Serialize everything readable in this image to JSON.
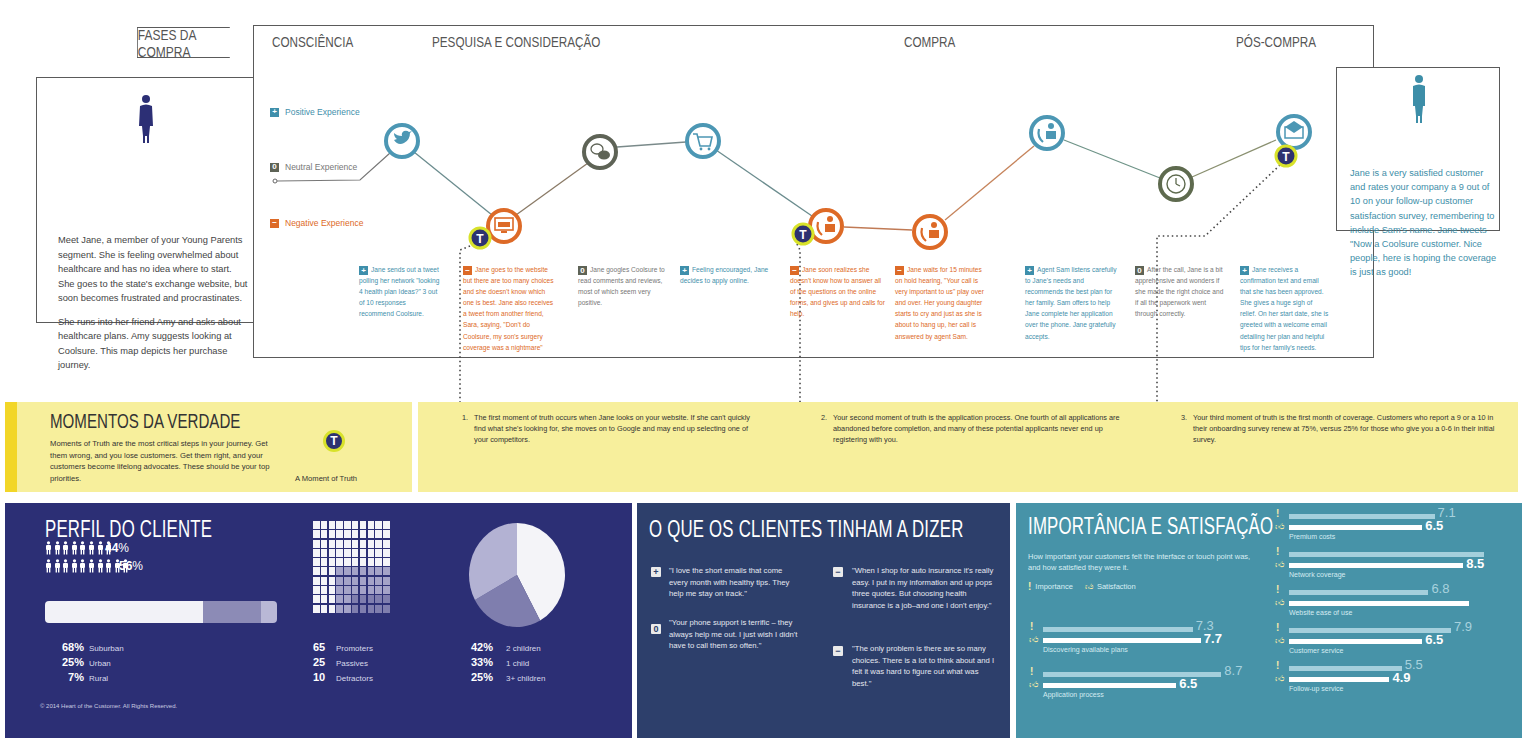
{
  "header": {
    "phases_label": "FASES DA COMPRA",
    "phases": [
      "CONSCIÊNCIA",
      "PESQUISA E CONSIDERAÇÃO",
      "COMPRA",
      "PÓS-COMPRA"
    ]
  },
  "persona_start": {
    "paragraphs": [
      "Meet Jane, a member of your Young Parents segment. She is feeling overwhelmed about healthcare and has no idea where to start. She goes to the state's exchange website, but soon becomes frustrated and procrastinates.",
      "She runs into her friend Amy and asks about healthcare plans. Amy suggests looking at Coolsure. This map depicts her purchase journey."
    ]
  },
  "persona_end": {
    "text": "Jane is a very satisfied customer and rates your company a 9 out of 10 on your follow-up customer satisfaction survey, remembering to include Sam's name. Jane tweets \"Now a Coolsure customer. Nice people, here is hoping the coverage is just as good!"
  },
  "legend": {
    "positive": {
      "icon": "+",
      "label": "Positive Experience",
      "color": "#3f8fab"
    },
    "neutral": {
      "icon": "0",
      "label": "Neutral Experience",
      "color": "#5e6356"
    },
    "negative": {
      "icon": "−",
      "label": "Negative Experience",
      "color": "#dd6a27"
    }
  },
  "journey": {
    "touchpoints": [
      {
        "icon": "twitter-icon",
        "type": "positive",
        "x": 402,
        "y": 141,
        "moment_of_truth": false
      },
      {
        "icon": "website-icon",
        "type": "negative",
        "x": 504,
        "y": 226,
        "moment_of_truth": true
      },
      {
        "icon": "chat-icon",
        "type": "neutral",
        "x": 600,
        "y": 152,
        "moment_of_truth": false
      },
      {
        "icon": "cart-icon",
        "type": "positive",
        "x": 703,
        "y": 141,
        "moment_of_truth": false
      },
      {
        "icon": "phone-agent-icon",
        "type": "negative",
        "x": 826,
        "y": 226,
        "moment_of_truth": true
      },
      {
        "icon": "phone-agent-icon",
        "type": "negative",
        "x": 930,
        "y": 232,
        "moment_of_truth": false
      },
      {
        "icon": "phone-agent-icon",
        "type": "positive",
        "x": 1047,
        "y": 133,
        "moment_of_truth": false
      },
      {
        "icon": "clock-icon",
        "type": "neutral",
        "x": 1176,
        "y": 184,
        "moment_of_truth": false
      },
      {
        "icon": "email-icon",
        "type": "positive",
        "x": 1294,
        "y": 132,
        "moment_of_truth": true
      }
    ],
    "steps": [
      {
        "type": "positive",
        "icon": "+",
        "text": "Jane sends out a tweet polling her network \"looking 4 health plan Ideas?\" 3 out of 10 responses recommend Coolsure."
      },
      {
        "type": "negative",
        "icon": "−",
        "text": "Jane goes to the website but there are too many choices and she doesn't know which one is best. Jane also receives a tweet from another friend, Sara, saying, \"Don't do Coolsure, my son's surgery coverage was a nightmare\""
      },
      {
        "type": "neutral",
        "icon": "0",
        "text": "Jane googles Coolsure to read comments and reviews, most of which seem very positive."
      },
      {
        "type": "positive",
        "icon": "+",
        "text": "Feeling encouraged, Jane decides to apply online."
      },
      {
        "type": "negative",
        "icon": "−",
        "text": "Jane soon realizes she doesn't know how to answer all of the questions on the online forms, and gives up and calls for help."
      },
      {
        "type": "negative",
        "icon": "−",
        "text": "Jane waits for 15 minutes on hold hearing, \"Your call is very important to us\" play over and over. Her young daughter starts to cry and just as she is about to hang up, her call is answered by agent Sam."
      },
      {
        "type": "positive",
        "icon": "+",
        "text": "Agent Sam listens carefully to Jane's needs and recommends the best plan for her family. Sam offers to help Jane complete her application over the phone. Jane gratefully accepts."
      },
      {
        "type": "neutral",
        "icon": "0",
        "text": "After the call, Jane is a bit apprehensive and wonders if she made the right choice and if all the paperwork went through correctly."
      },
      {
        "type": "positive",
        "icon": "+",
        "text": "Jane receives a confirmation text and email that she has been approved. She gives a huge sigh of relief. On her start date, she is greeted with a welcome email detailing her plan and helpful tips for her family's needs."
      }
    ]
  },
  "moments_of_truth": {
    "title": "MOMENTOS DA VERDADE",
    "description": "Moments of Truth are the most critical steps in your journey. Get them wrong, and you lose customers. Get them right, and your customers become lifelong advocates. These should be your top priorities.",
    "badge_letter": "T",
    "badge_label": "A Moment of Truth",
    "items": [
      {
        "number": "1.",
        "text": "The first moment of truth occurs when Jane looks on your website. If she can't quickly find what she's looking for, she moves on to Google and may end up selecting one of your competitors."
      },
      {
        "number": "2.",
        "text": "Your second moment of truth is the application process. One fourth of all applications are abandoned before completion, and many of these potential applicants never end up registering with you."
      },
      {
        "number": "3.",
        "text": "Your third moment of truth is the first month of coverage. Customers who report a 9 or a 10 in their onboarding survey renew at 75%, versus 25% for those who give you a 0-6 in their initial survey."
      }
    ]
  },
  "profile": {
    "title": "PERFIL DO CLIENTE",
    "gender": [
      {
        "value": "44",
        "unit": "%",
        "count": 8
      },
      {
        "value": "56",
        "unit": "%",
        "count": 10
      }
    ],
    "location": [
      {
        "value": "68%",
        "label": "Suburban",
        "color": "#f2f2f7"
      },
      {
        "value": "25%",
        "label": "Urban",
        "color": "#8c8bb6"
      },
      {
        "value": "7%",
        "label": "Rural",
        "color": "#b9b8d6"
      }
    ],
    "nps": [
      {
        "value": "65",
        "label": "Promoters",
        "color": "#f4f4f8"
      },
      {
        "value": "25",
        "label": "Passives",
        "color": "#a4a3c8"
      },
      {
        "value": "10",
        "label": "Detractors",
        "color": "#7f7eae"
      }
    ],
    "children": [
      {
        "value": "42%",
        "label": "2 children",
        "color": "#f4f4f8"
      },
      {
        "value": "33%",
        "label": "1 child",
        "color": "#b3b2d3"
      },
      {
        "value": "25%",
        "label": "3+ children",
        "color": "#7f7eae"
      }
    ],
    "copyright": "© 2014 Heart of the Customer. All Rights Reserved."
  },
  "quotes": {
    "title": "O QUE OS CLIENTES TINHAM A DIZER",
    "items": [
      {
        "icon": "+",
        "text": "\"I love the short emails that come every month with healthy tips. They help me stay on track.\""
      },
      {
        "icon": "0",
        "text": "\"Your phone support is terrific – they always help me out. I just wish I didn't have to call them so often.\""
      },
      {
        "icon": "−",
        "text": "\"When I shop for auto insurance it's really easy. I put in my information and up pops three quotes. But choosing health insurance is a job–and one I don't enjoy.\""
      },
      {
        "icon": "−",
        "text": "\"The only problem is there are so many choices. There is a lot to think about and I felt it was hard to figure out what was best.\""
      }
    ]
  },
  "importance": {
    "title": "IMPORTÂNCIA E SATISFAÇÃO",
    "description": "How important your customers felt the interface or touch point was, and how satisfied they were it.",
    "legend_importance": "Importance",
    "legend_satisfaction": "Satisfaction",
    "colors": {
      "importance": "#a4cfdc",
      "satisfaction": "#ffffff",
      "background": "#4793a8"
    }
  },
  "chart_data": {
    "type": "bar",
    "title": "IMPORTÂNCIA E SATISFAÇÃO",
    "orientation": "horizontal",
    "categories": [
      "Discovering available plans",
      "Application process",
      "Premium costs",
      "Network coverage",
      "Website ease of use",
      "Customer service",
      "Follow-up service"
    ],
    "series": [
      {
        "name": "Importance",
        "values": [
          7.3,
          8.7,
          7.1,
          9.5,
          6.8,
          7.9,
          5.5
        ],
        "labels": [
          "7.3",
          "8.7",
          "7.1",
          "",
          "6.8",
          "7.9",
          "5.5"
        ]
      },
      {
        "name": "Satisfaction",
        "values": [
          7.7,
          6.5,
          6.5,
          8.5,
          8.8,
          6.5,
          4.9
        ],
        "labels": [
          "7.7",
          "6.5",
          "6.5",
          "8.5",
          "",
          "6.5",
          "4.9"
        ]
      }
    ],
    "xlim": [
      0,
      10
    ],
    "grid": false,
    "legend_position": "top-left"
  }
}
